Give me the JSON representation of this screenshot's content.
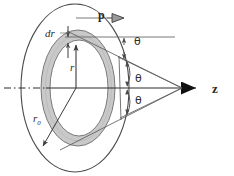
{
  "figure": {
    "background_color": "#ffffff",
    "line_color": "#3a3a3a",
    "axis_color": "#2b2b2b",
    "ring_fill_color": "#c8c8c8",
    "ring_edge_color": "#6e6e6e",
    "labels": {
      "dr": "dr",
      "r": "r",
      "r0_base": "r",
      "r0_sub": "0",
      "p": "p",
      "z": "z",
      "theta_top": "θ",
      "theta_mid": "θ",
      "theta_bottom": "θ"
    },
    "icons": {
      "p_arrow": "thick-right-arrow-icon",
      "z_arrow": "thick-right-arrowhead-icon",
      "dr_arrow_up": "up-arrowhead-icon",
      "dr_arrow_down": "down-arrowhead-icon",
      "r_arrow": "up-arrowhead-icon",
      "r0_arrow": "down-left-arrowhead-icon",
      "theta_top_arrows": "vertical-double-arrow-icon",
      "theta_mid_arc": "angle-arc-double-arrow-icon",
      "theta_bottom_arc": "angle-arc-double-arrow-icon",
      "centerline": "dash-dot-centerline-icon"
    },
    "geometry": {
      "outer_ellipse": {
        "cx": 75,
        "cy": 88,
        "rx": 54,
        "ry": 84
      },
      "ring_outer_ellipse": {
        "cx": 78,
        "cy": 88,
        "rx": 37,
        "ry": 58
      },
      "ring_inner_ellipse": {
        "cx": 79,
        "cy": 88,
        "rx": 29,
        "ry": 48
      },
      "apex": {
        "x": 182,
        "y": 88
      },
      "z_axis": {
        "x1": 4,
        "y1": 88,
        "x2": 196,
        "y2": 88
      }
    }
  }
}
